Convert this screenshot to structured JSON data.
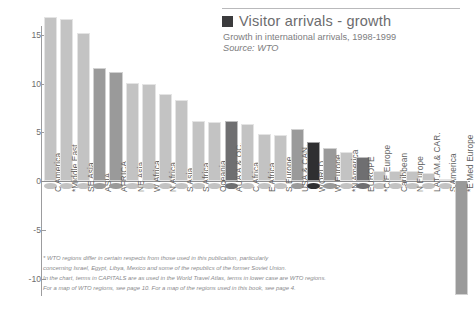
{
  "header": {
    "legend_label": "Visitor arrivals - growth",
    "subtitle": "Growth in international arrivals, 1998-1999",
    "source": "Source: WTO",
    "legend_swatch_color": "#3b3b3d"
  },
  "footnote": {
    "line1": "* WTO regions differ in certain respects from those used in this publication, particularly",
    "line2": "concerning Israel, Egypt, Libya, Mexico and some of the republics of the former Soviet Union.",
    "line3": "In the chart, terms in CAPITALS are as used in the World Travel Atlas, terms in lower case are WTO regions.",
    "line4": "For a map of WTO regions, see page 10. For a map of the regions used in this book, see page 4."
  },
  "colors": {
    "bar_light": "#c3c3c3",
    "bar_medium": "#9a9a9a",
    "bar_dark": "#6f6f71",
    "bar_black": "#2f2f31",
    "axis": "#9c9c9e",
    "text": "#6e6e70"
  },
  "chart_data": {
    "type": "bar",
    "title": "Visitor arrivals - growth",
    "subtitle": "Growth in international arrivals, 1998-1999",
    "source": "Source: WTO",
    "xlabel": "",
    "ylabel": "",
    "ylim": [
      -12.5,
      17.5
    ],
    "yticks": [
      15,
      10,
      5,
      0,
      -5,
      -10
    ],
    "grid": false,
    "legend_position": "top-right",
    "categories": [
      "C America",
      "*Middle East",
      "SE Asia",
      "ASIA",
      "AFRICA",
      "NE Asia",
      "W Africa",
      "N Africa",
      "S Asia",
      "S Africa",
      "Oceania",
      "AUA'A & OC.",
      "C Africa",
      "E Africa",
      "S Europe",
      "USA & CAN.",
      "WORLD",
      "W Europe",
      "*N America",
      "EUROPE",
      "*C/E Europe",
      "Caribbean",
      "N Europe",
      "LAT.AM.& CAR.",
      "S America",
      "*E Med Europe"
    ],
    "values": [
      16.8,
      16.6,
      15.2,
      11.6,
      11.2,
      10.1,
      10.0,
      8.9,
      8.3,
      6.2,
      6.1,
      6.2,
      5.8,
      4.8,
      4.7,
      5.3,
      4.0,
      3.4,
      3.0,
      2.5,
      1.0,
      1.0,
      1.0,
      0.8,
      0.2,
      -11.7
    ],
    "bar_shades": [
      "light",
      "light",
      "light",
      "medium",
      "medium",
      "light",
      "light",
      "light",
      "light",
      "light",
      "light",
      "dark",
      "light",
      "light",
      "light",
      "medium",
      "black",
      "medium",
      "light",
      "dark",
      "light",
      "light",
      "light",
      "light",
      "light",
      "medium"
    ]
  }
}
